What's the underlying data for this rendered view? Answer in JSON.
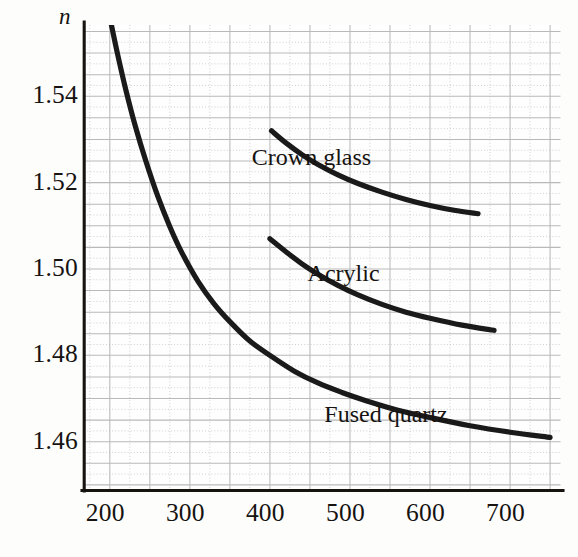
{
  "chart_data": {
    "type": "line",
    "title": "",
    "subtitle": "",
    "xlabel": "",
    "ylabel": "n",
    "ylabel_note": "index of refraction",
    "xlim": [
      168,
      763
    ],
    "ylim": [
      1.4487,
      1.5565
    ],
    "grid": true,
    "grid_major_x_step": 50,
    "grid_major_y_step": 0.005,
    "grid_minor_x_step": 25,
    "grid_minor_y_step": 0.0025,
    "legend_position": "inline-annotations",
    "xticks": [
      200,
      300,
      400,
      500,
      600,
      700
    ],
    "xtick_labels": [
      "200",
      "300",
      "400",
      "500",
      "600",
      "700"
    ],
    "yticks": [
      1.46,
      1.48,
      1.5,
      1.52,
      1.54
    ],
    "ytick_labels": [
      "1.46",
      "1.48",
      "1.50",
      "1.52",
      "1.54"
    ],
    "line_color": "#1a1a1a",
    "grid_major_color": "#b9b9b9",
    "grid_minor_color": "#cfcfcf",
    "axis_color": "#1a1a1a",
    "series": [
      {
        "name": "Fused quartz",
        "label": "Fused quartz",
        "label_x": 545,
        "label_y": 1.4655,
        "x": [
          202,
          210,
          220,
          232,
          245,
          260,
          275,
          290,
          310,
          330,
          350,
          375,
          400,
          430,
          460,
          490,
          520,
          560,
          600,
          650,
          700,
          750
        ],
        "y": [
          1.5565,
          1.5495,
          1.5415,
          1.533,
          1.525,
          1.5168,
          1.5098,
          1.5038,
          1.4972,
          1.492,
          1.4878,
          1.4833,
          1.48,
          1.4764,
          1.4736,
          1.4714,
          1.4695,
          1.4673,
          1.4656,
          1.4637,
          1.4622,
          1.461
        ]
      },
      {
        "name": "Crown glass",
        "label": "Crown glass",
        "label_x": 452,
        "label_y": 1.525,
        "x": [
          402,
          420,
          440,
          460,
          485,
          510,
          540,
          570,
          600,
          630,
          660
        ],
        "y": [
          1.532,
          1.5292,
          1.5265,
          1.5242,
          1.5218,
          1.5198,
          1.5178,
          1.5161,
          1.5147,
          1.5136,
          1.5128
        ]
      },
      {
        "name": "Acrylic",
        "label": "Acrylic",
        "label_x": 492,
        "label_y": 1.4982,
        "x": [
          400,
          420,
          440,
          460,
          485,
          510,
          540,
          570,
          600,
          640,
          680
        ],
        "y": [
          1.507,
          1.504,
          1.5012,
          1.4988,
          1.4962,
          1.494,
          1.4918,
          1.49,
          1.4886,
          1.487,
          1.4858
        ]
      }
    ]
  },
  "axis": {
    "y_axis_name": "n"
  }
}
